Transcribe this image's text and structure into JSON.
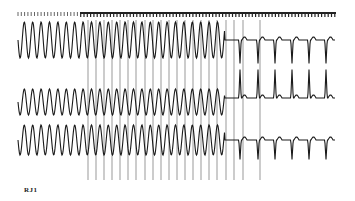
{
  "figure": {
    "label": "RJ1",
    "colors": {
      "trace": "#1a1a1a",
      "spike": "#555555",
      "marker": "#222222",
      "background": "#ffffff"
    }
  },
  "time_markers": {
    "x_start": 18,
    "x_end": 336,
    "y": 12,
    "spacing": 3.3,
    "dense_from": 80,
    "dense_to": 336
  },
  "pacing_spikes": {
    "x": [
      88,
      96,
      104,
      112,
      120,
      128,
      136,
      145,
      153,
      161,
      169,
      177,
      185,
      193,
      201,
      209,
      217,
      226,
      234,
      243,
      260
    ],
    "y_top": 20,
    "y_bottom": 180
  },
  "traces": [
    {
      "name": "lead-1",
      "baseline": 40,
      "amp": 18,
      "tachy_end_x": 225,
      "vt_cycle": 8.4,
      "start_x": 18,
      "end_x": 335,
      "sinus_beats_x": [
        240,
        258,
        275,
        292,
        309,
        326
      ]
    },
    {
      "name": "lead-2",
      "baseline": 102,
      "amp": 13,
      "tachy_end_x": 225,
      "vt_cycle": 8.4,
      "start_x": 18,
      "end_x": 335,
      "sinus_beats_x": [
        240,
        258,
        275,
        292,
        309,
        326
      ]
    },
    {
      "name": "lead-3",
      "baseline": 140,
      "amp": 15,
      "tachy_end_x": 225,
      "vt_cycle": 8.4,
      "start_x": 18,
      "end_x": 335,
      "sinus_beats_x": [
        240,
        258,
        275,
        292,
        309,
        326
      ]
    }
  ]
}
